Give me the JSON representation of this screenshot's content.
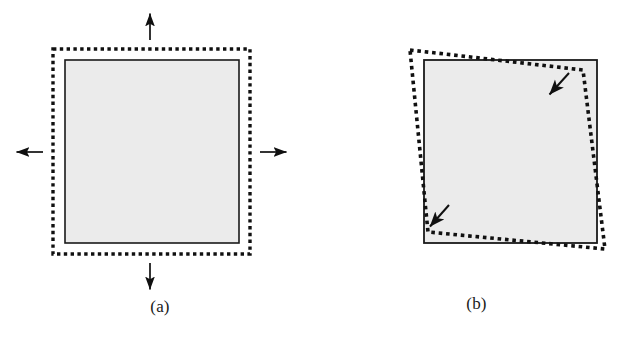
{
  "figure": {
    "title": "",
    "background_color": "#ffffff",
    "width": 633,
    "height": 339,
    "panels": [
      {
        "id": "a",
        "caption": "(a)",
        "description": "Solid-outline filled square with a dotted outline expanded uniformly outward, and four straight arrows pointing outward (up, down, left, right).",
        "solid_shape": {
          "name": "solid-square",
          "type": "rectangle",
          "stroke_color": "#1a1a1a",
          "fill_color": "#ebebeb",
          "stroke_width": 1.6,
          "points": [
            [
              65,
              60
            ],
            [
              239,
              60
            ],
            [
              239,
              243
            ],
            [
              65,
              243
            ]
          ]
        },
        "dotted_shape": {
          "name": "dotted-expanded-square",
          "type": "rectangle",
          "stroke_color": "#101010",
          "fill_color": "none",
          "stroke_width": 3.4,
          "dash_pattern": "3.4 3.4",
          "points": [
            [
              53,
              49
            ],
            [
              250,
              49
            ],
            [
              250,
              254
            ],
            [
              53,
              254
            ]
          ]
        },
        "arrows": [
          {
            "name": "arrow-up",
            "direction": "up",
            "x1": 150,
            "y1": 40,
            "x2": 150,
            "y2": 11
          },
          {
            "name": "arrow-down",
            "direction": "down",
            "x1": 150,
            "y1": 263,
            "x2": 150,
            "y2": 292
          },
          {
            "name": "arrow-left",
            "direction": "left",
            "x1": 43,
            "y1": 152,
            "x2": 14,
            "y2": 152
          },
          {
            "name": "arrow-right",
            "direction": "right",
            "x1": 260,
            "y1": 152,
            "x2": 289,
            "y2": 152
          }
        ]
      },
      {
        "id": "b",
        "caption": "(b)",
        "description": "Solid-outline filled square with a dotted outline rotated/tilted relative to it, crossing the square edges, with two short arrows pointing inward at the top-right and bottom-left.",
        "solid_shape": {
          "name": "solid-square",
          "type": "rectangle",
          "stroke_color": "#1a1a1a",
          "fill_color": "#ebebeb",
          "stroke_width": 1.8,
          "points": [
            [
              104,
              60
            ],
            [
              277,
              60
            ],
            [
              277,
              243
            ],
            [
              104,
              243
            ]
          ]
        },
        "dotted_shape": {
          "name": "dotted-rotated-square",
          "type": "quadrilateral",
          "stroke_color": "#101010",
          "fill_color": "none",
          "stroke_width": 3.6,
          "dash_pattern": "3.6 3.8",
          "points": [
            [
              90,
              50
            ],
            [
              263,
              70
            ],
            [
              285,
              249
            ],
            [
              108,
              232
            ]
          ]
        },
        "arrows": [
          {
            "name": "arrow-inward-top-right",
            "direction": "down-left",
            "x1": 248,
            "y1": 74,
            "x2": 227,
            "y2": 97
          },
          {
            "name": "arrow-inward-bottom-left",
            "direction": "down-left",
            "x1": 128,
            "y1": 206,
            "x2": 108,
            "y2": 229
          }
        ]
      }
    ]
  }
}
